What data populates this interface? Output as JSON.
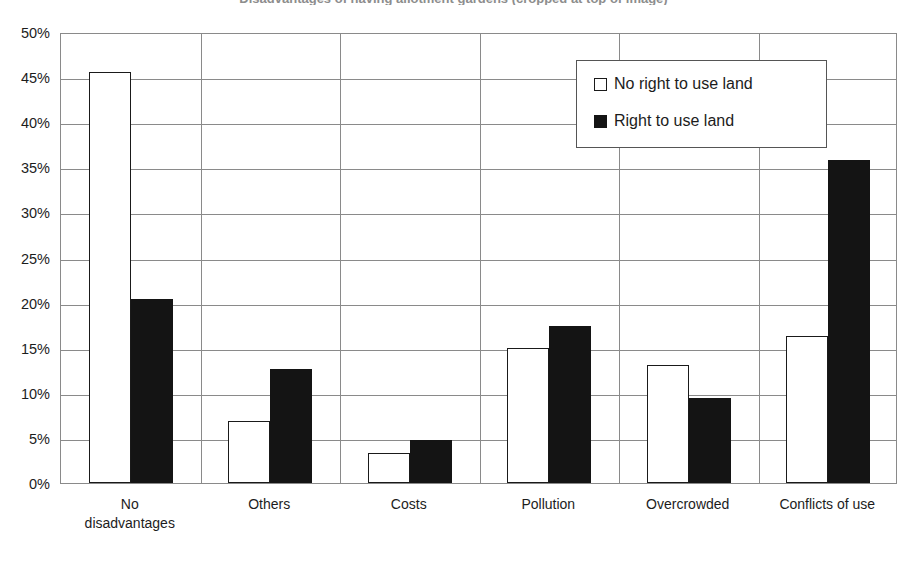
{
  "chart_data": {
    "type": "bar",
    "title": "Disadvantages of having allotment gardens (cropped at top of image)",
    "xlabel": "",
    "ylabel": "",
    "ylim": [
      0,
      50
    ],
    "ytick_values": [
      50,
      45,
      40,
      35,
      30,
      25,
      20,
      15,
      10,
      5,
      0
    ],
    "ytick_labels": [
      "50%",
      "45%",
      "40%",
      "35%",
      "30%",
      "25%",
      "20%",
      "15%",
      "10%",
      "5%",
      "0%"
    ],
    "categories": [
      "No disadvantages",
      "Others",
      "Costs",
      "Pollution",
      "Overcrowded",
      "Conflicts of use"
    ],
    "category_lines": [
      [
        "No",
        "disadvantages"
      ],
      [
        "Others",
        ""
      ],
      [
        "Costs",
        ""
      ],
      [
        "Pollution",
        ""
      ],
      [
        "Overcrowded",
        ""
      ],
      [
        "Conflicts of use",
        ""
      ]
    ],
    "series": [
      {
        "name": "No right to use land",
        "fill": "#ffffff",
        "stroke": "#1a1a1a",
        "values": [
          45.6,
          6.9,
          3.3,
          15.0,
          13.1,
          16.3
        ]
      },
      {
        "name": "Right to use land",
        "fill": "#141414",
        "stroke": "#141414",
        "values": [
          20.4,
          12.6,
          4.8,
          17.4,
          9.4,
          35.8
        ]
      }
    ],
    "grid": {
      "horizontal": true,
      "vertical": true,
      "color": "#8a8a8a"
    },
    "legend": {
      "position": "top-right-inside",
      "entries": [
        "No right to use land",
        "Right to use land"
      ]
    }
  }
}
